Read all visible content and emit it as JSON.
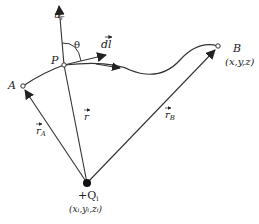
{
  "diagram": {
    "type": "vector-field-path",
    "points": {
      "A": {
        "label": "A"
      },
      "P": {
        "label": "P"
      },
      "B": {
        "label": "B",
        "coords": "(x,y,z)"
      },
      "Q": {
        "label": "+Q",
        "subscript": "i",
        "coords": "(x",
        "coords_full": "(xᵢ,yᵢ,zᵢ)"
      }
    },
    "vectors": {
      "unit_r": "û",
      "unit_r_sub": "r",
      "dl": "dl",
      "r": "r",
      "rA": "r",
      "rA_sub": "A",
      "rB": "r",
      "rB_sub": "B"
    },
    "angle": "θ",
    "colors": {
      "line": "#333333",
      "text": "#222222",
      "background": "#ffffff"
    }
  }
}
